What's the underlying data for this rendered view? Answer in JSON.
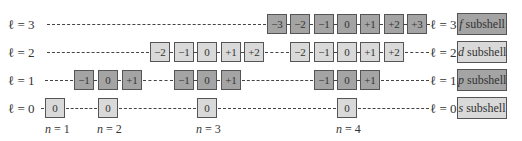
{
  "diagram": {
    "colors": {
      "dark_box": "#a4a4a4",
      "light_box": "#d9d9d9",
      "border": "#555555"
    },
    "rows": [
      {
        "l_label_left": "ℓ = 3",
        "l_label_right": "ℓ = 3",
        "subshell_letter": "f",
        "subshell_word": "subshell",
        "shade": "dark",
        "groups": [
          {
            "n": 4,
            "values": [
              "−3",
              "−2",
              "−1",
              "0",
              "+1",
              "+2",
              "+3"
            ]
          }
        ]
      },
      {
        "l_label_left": "ℓ = 2",
        "l_label_right": "ℓ = 2",
        "subshell_letter": "d",
        "subshell_word": "subshell",
        "shade": "light",
        "groups": [
          {
            "n": 3,
            "values": [
              "−2",
              "−1",
              "0",
              "+1",
              "+2"
            ]
          },
          {
            "n": 4,
            "values": [
              "−2",
              "−1",
              "0",
              "+1",
              "+2"
            ]
          }
        ]
      },
      {
        "l_label_left": "ℓ = 1",
        "l_label_right": "ℓ = 1",
        "subshell_letter": "p",
        "subshell_word": "subshell",
        "shade": "dark",
        "groups": [
          {
            "n": 2,
            "values": [
              "−1",
              "0",
              "+1"
            ]
          },
          {
            "n": 3,
            "values": [
              "−1",
              "0",
              "+1"
            ]
          },
          {
            "n": 4,
            "values": [
              "−1",
              "0",
              "+1"
            ]
          }
        ]
      },
      {
        "l_label_left": "ℓ = 0",
        "l_label_right": "ℓ = 0",
        "subshell_letter": "s",
        "subshell_word": "subshell",
        "shade": "light",
        "groups": [
          {
            "n": 1,
            "values": [
              "0"
            ]
          },
          {
            "n": 2,
            "values": [
              "0"
            ]
          },
          {
            "n": 3,
            "values": [
              "0"
            ]
          },
          {
            "n": 4,
            "values": [
              "0"
            ]
          }
        ]
      }
    ],
    "n_labels": [
      {
        "var": "n",
        "text": " = 1"
      },
      {
        "var": "n",
        "text": " = 2"
      },
      {
        "var": "n",
        "text": " = 3"
      },
      {
        "var": "n",
        "text": " = 4"
      }
    ]
  }
}
